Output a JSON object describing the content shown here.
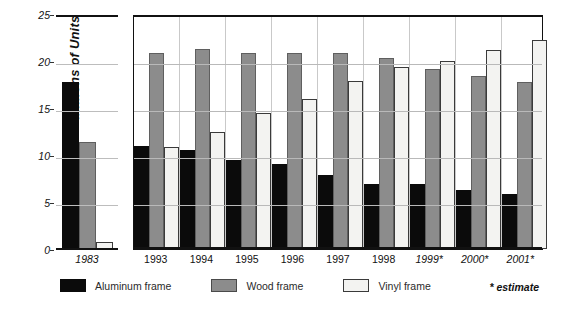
{
  "chart_data": {
    "type": "bar",
    "title": "",
    "xlabel": "",
    "ylabel": "Millions of Units",
    "ylim": [
      0,
      25
    ],
    "yticks": [
      0,
      5,
      10,
      15,
      20,
      25
    ],
    "grid": true,
    "legend_position": "bottom",
    "legend": [
      "Aluminum frame",
      "Wood frame",
      "Vinyl frame"
    ],
    "annotations": [
      "* estimate"
    ],
    "panels": [
      {
        "name": "baseline-year",
        "categories": [
          "1983"
        ],
        "series": [
          {
            "name": "Aluminum frame",
            "values": [
              17.9
            ]
          },
          {
            "name": "Wood frame",
            "values": [
              11.5
            ]
          },
          {
            "name": "Vinyl frame",
            "values": [
              0.8
            ]
          }
        ]
      },
      {
        "name": "recent-years",
        "categories": [
          "1993",
          "1994",
          "1995",
          "1996",
          "1997",
          "1998",
          "1999*",
          "2000*",
          "2001*"
        ],
        "series": [
          {
            "name": "Aluminum frame",
            "values": [
              11.0,
              10.5,
              9.5,
              9.0,
              7.9,
              6.9,
              6.9,
              6.3,
              5.8
            ]
          },
          {
            "name": "Wood frame",
            "values": [
              20.9,
              21.3,
              20.9,
              20.9,
              20.9,
              20.3,
              19.1,
              18.4,
              17.8
            ]
          },
          {
            "name": "Vinyl frame",
            "values": [
              10.9,
              12.4,
              14.5,
              16.0,
              17.9,
              19.4,
              20.0,
              21.2,
              22.2
            ]
          }
        ]
      }
    ]
  },
  "yaxis": {
    "label": "Millions of Units",
    "ticks": [
      "25",
      "20",
      "15",
      "10",
      "5",
      "0"
    ]
  },
  "panelA": {
    "category": "1983"
  },
  "panelB": {
    "categories": [
      "1993",
      "1994",
      "1995",
      "1996",
      "1997",
      "1998",
      "1999*",
      "2000*",
      "2001*"
    ]
  },
  "legend": {
    "items": [
      {
        "label": "Aluminum frame",
        "color": "#0b0b0b",
        "swatch": "alum"
      },
      {
        "label": "Wood frame",
        "color": "#8c8c8c",
        "swatch": "wood"
      },
      {
        "label": "Vinyl frame",
        "color": "#f3f3f1",
        "swatch": "vinyl"
      }
    ],
    "note": "* estimate"
  },
  "caption": {
    "text": ""
  },
  "colors": {
    "aluminum": "#0b0b0b",
    "wood": "#8c8c8c",
    "vinyl": "#f3f3f1",
    "axis": "#111111",
    "grid": "#b9b9b9"
  }
}
